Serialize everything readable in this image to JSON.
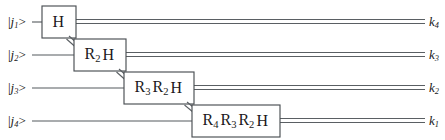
{
  "diagram": {
    "colors": {
      "wire": "#555a5e",
      "box_stroke": "#4a4f53",
      "box_fill": "#ffffff",
      "text": "#1b1b1b",
      "background": "#ffffff"
    }
  },
  "inputs": [
    {
      "id": "in-1",
      "ket_open": "|",
      "symbol": "j",
      "subscript": "1",
      "ket_close": ">",
      "text": "|j1>"
    },
    {
      "id": "in-2",
      "ket_open": "|",
      "symbol": "j",
      "subscript": "2",
      "ket_close": ">",
      "text": "|j2>"
    },
    {
      "id": "in-3",
      "ket_open": "|",
      "symbol": "j",
      "subscript": "3",
      "ket_close": ">",
      "text": "|j3>"
    },
    {
      "id": "in-4",
      "ket_open": "|",
      "symbol": "j",
      "subscript": "4",
      "ket_close": ">",
      "text": "|j4>"
    }
  ],
  "outputs": [
    {
      "id": "out-1",
      "symbol": "k",
      "subscript": "4",
      "text": "k4"
    },
    {
      "id": "out-2",
      "symbol": "k",
      "subscript": "3",
      "text": "k3"
    },
    {
      "id": "out-3",
      "symbol": "k",
      "subscript": "2",
      "text": "k2"
    },
    {
      "id": "out-4",
      "symbol": "k",
      "subscript": "1",
      "text": "k1"
    }
  ],
  "gates": [
    {
      "id": "gate-1",
      "wire": 1,
      "text": "H",
      "terms": [
        {
          "base": "H",
          "sub": ""
        }
      ]
    },
    {
      "id": "gate-2",
      "wire": 2,
      "text": "R2 H",
      "terms": [
        {
          "base": "R",
          "sub": "2"
        },
        {
          "base": "H",
          "sub": ""
        }
      ]
    },
    {
      "id": "gate-3",
      "wire": 3,
      "text": "R3 R2 H",
      "terms": [
        {
          "base": "R",
          "sub": "3"
        },
        {
          "base": "R",
          "sub": "2"
        },
        {
          "base": "H",
          "sub": ""
        }
      ]
    },
    {
      "id": "gate-4",
      "wire": 4,
      "text": "R4 R3 R2 H",
      "terms": [
        {
          "base": "R",
          "sub": "4"
        },
        {
          "base": "R",
          "sub": "3"
        },
        {
          "base": "R",
          "sub": "2"
        },
        {
          "base": "H",
          "sub": ""
        }
      ]
    }
  ],
  "connectors": [
    {
      "id": "connector-1-2",
      "from_gate": "gate-1",
      "to_gate": "gate-2"
    },
    {
      "id": "connector-2-3",
      "from_gate": "gate-2",
      "to_gate": "gate-3"
    },
    {
      "id": "connector-3-4",
      "from_gate": "gate-3",
      "to_gate": "gate-4"
    }
  ]
}
